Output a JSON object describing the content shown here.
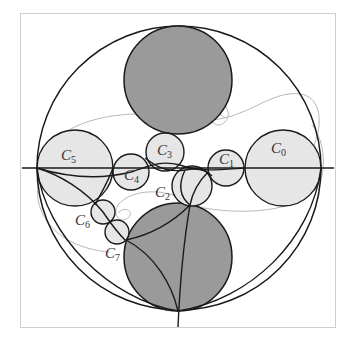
{
  "figure": {
    "colors": {
      "dark_disc": "#9a9a9a",
      "light_disc": "#e6e6e6",
      "stroke": "#1a1a1a",
      "spiral": "#b8b8b8",
      "frame": "#cfcfcf"
    },
    "outer_circle": {
      "cx": 179,
      "cy": 168,
      "r": 142
    },
    "dark_discs": [
      {
        "name": "upper-disc",
        "cx": 178,
        "cy": 80,
        "r": 54
      },
      {
        "name": "lower-disc",
        "cx": 178,
        "cy": 257,
        "r": 54
      }
    ],
    "circles": [
      {
        "id": "C0",
        "base": "C",
        "sub": "0",
        "cx": 283,
        "cy": 168,
        "r": 38,
        "lx": 271,
        "ly": 153
      },
      {
        "id": "C1",
        "base": "C",
        "sub": "1",
        "cx": 226,
        "cy": 168,
        "r": 18,
        "lx": 219,
        "ly": 164
      },
      {
        "id": "C2",
        "base": "C",
        "sub": "2",
        "cx": 192,
        "cy": 186,
        "r": 20,
        "lx": 155,
        "ly": 197
      },
      {
        "id": "C3",
        "base": "C",
        "sub": "3",
        "cx": 165,
        "cy": 152,
        "r": 19,
        "lx": 157,
        "ly": 155
      },
      {
        "id": "C4",
        "base": "C",
        "sub": "4",
        "cx": 131,
        "cy": 172,
        "r": 18,
        "lx": 124,
        "ly": 180
      },
      {
        "id": "C5",
        "base": "C",
        "sub": "5",
        "cx": 75,
        "cy": 168,
        "r": 38,
        "lx": 61,
        "ly": 160
      },
      {
        "id": "C6",
        "base": "C",
        "sub": "6",
        "cx": 103,
        "cy": 212,
        "r": 12,
        "lx": 75,
        "ly": 225
      },
      {
        "id": "C7",
        "base": "C",
        "sub": "7",
        "cx": 117,
        "cy": 232,
        "r": 12,
        "lx": 105,
        "ly": 258
      }
    ]
  }
}
